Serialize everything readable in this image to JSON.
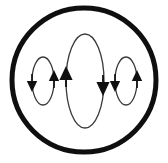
{
  "canvas": {
    "width": 168,
    "height": 163,
    "background_color": "#ffffff"
  },
  "figure": {
    "name": "circulation-loops-diagram",
    "type": "schematic-vector-field",
    "outer_boundary": {
      "shape": "circle",
      "center_x": 84,
      "center_y": 80,
      "radius": 72,
      "stroke_color": "#100f0f",
      "stroke_width": 5,
      "fill": "none"
    },
    "loops": [
      {
        "id": "left-loop",
        "shape": "ellipse",
        "center_x": 43,
        "center_y": 81,
        "radius_x": 11,
        "radius_y": 24,
        "stroke_color": "#3a3a3a",
        "stroke_width": 1.3,
        "fill": "none",
        "circulation": "clockwise",
        "arrows": [
          {
            "id": "left-loop-arrow-left",
            "side": "left",
            "direction": "down",
            "tip_x": 32,
            "tip_y": 92,
            "size": 11
          },
          {
            "id": "left-loop-arrow-right",
            "side": "right",
            "direction": "up",
            "tip_x": 54,
            "tip_y": 70,
            "size": 11
          }
        ]
      },
      {
        "id": "center-loop",
        "shape": "ellipse",
        "center_x": 85,
        "center_y": 81,
        "radius_x": 19,
        "radius_y": 47,
        "stroke_color": "#3a3a3a",
        "stroke_width": 1.3,
        "fill": "none",
        "circulation": "counterclockwise",
        "arrows": [
          {
            "id": "center-loop-arrow-left",
            "side": "left",
            "direction": "up",
            "tip_x": 66,
            "tip_y": 66,
            "size": 14
          },
          {
            "id": "center-loop-arrow-right",
            "side": "right",
            "direction": "down",
            "tip_x": 103,
            "tip_y": 96,
            "size": 14
          }
        ]
      },
      {
        "id": "right-loop",
        "shape": "ellipse",
        "center_x": 126,
        "center_y": 81,
        "radius_x": 11,
        "radius_y": 24,
        "stroke_color": "#3a3a3a",
        "stroke_width": 1.3,
        "fill": "none",
        "circulation": "clockwise",
        "arrows": [
          {
            "id": "right-loop-arrow-left",
            "side": "left",
            "direction": "down",
            "tip_x": 115,
            "tip_y": 92,
            "size": 11
          },
          {
            "id": "right-loop-arrow-right",
            "side": "right",
            "direction": "up",
            "tip_x": 137,
            "tip_y": 70,
            "size": 11
          }
        ]
      }
    ],
    "arrow_fill_color": "#100f0f",
    "labels": [],
    "text_present": false
  }
}
